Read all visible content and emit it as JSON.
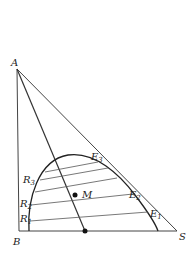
{
  "diagram": {
    "type": "ternary-phase-diagram-right-triangle",
    "vertices": {
      "A": "A",
      "B": "B",
      "S": "S"
    },
    "raffinate_points": [
      "R1",
      "R2",
      "R3"
    ],
    "extract_points": [
      "E1",
      "E2",
      "E3"
    ],
    "mixture_point": "M",
    "labels": {
      "A": "A",
      "B": "B",
      "S": "S",
      "M": "M",
      "R": "R",
      "E": "E",
      "r1": "1",
      "r2": "2",
      "r3": "3",
      "e1": "1",
      "e2": "2",
      "e3": "3"
    },
    "colors": {
      "line": "#333333",
      "background": "#ffffff"
    }
  }
}
